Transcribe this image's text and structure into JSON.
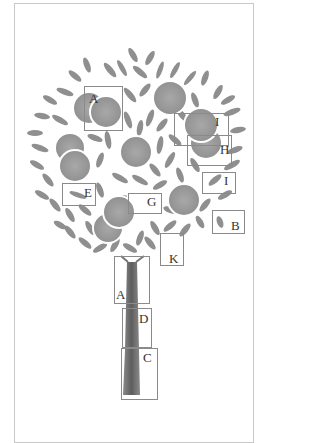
{
  "figure": {
    "title": "",
    "colors": {
      "frame": "#c8c8c8",
      "orange": "#9a9a9a",
      "leaf": "#7a7a7a",
      "trunk": "#6a6a6a",
      "box": "#8a8a8a",
      "label": "#333333"
    }
  },
  "labels": [
    {
      "id": "A_top",
      "text": "A",
      "box": [
        84,
        86,
        39,
        45
      ],
      "pos": [
        90,
        93
      ]
    },
    {
      "id": "I_upper",
      "text": "I",
      "box": [
        174,
        113,
        55,
        33
      ],
      "pos": [
        216,
        116
      ]
    },
    {
      "id": "H",
      "text": "H",
      "box": [
        187,
        135,
        45,
        31
      ],
      "pos": [
        221,
        144
      ]
    },
    {
      "id": "I_lower",
      "text": "I",
      "box": [
        202,
        172,
        34,
        22
      ],
      "pos": [
        225,
        175
      ]
    },
    {
      "id": "E",
      "text": "E",
      "box": [
        62,
        183,
        34,
        23
      ],
      "pos": [
        85,
        187
      ]
    },
    {
      "id": "G",
      "text": "G",
      "box": [
        128,
        193,
        34,
        21
      ],
      "pos": [
        148,
        196
      ]
    },
    {
      "id": "B",
      "text": "B",
      "box": [
        212,
        210,
        33,
        24
      ],
      "pos": [
        231,
        220
      ]
    },
    {
      "id": "K",
      "text": "K",
      "box": [
        160,
        233,
        24,
        33
      ],
      "pos": [
        169,
        253
      ]
    },
    {
      "id": "A_trunk",
      "text": "A",
      "box": [
        114,
        256,
        36,
        48
      ],
      "pos": [
        117,
        289
      ]
    },
    {
      "id": "D",
      "text": "D",
      "box": [
        122,
        308,
        30,
        40
      ],
      "pos": [
        140,
        313
      ]
    },
    {
      "id": "C",
      "text": "C",
      "box": [
        121,
        348,
        37,
        52
      ],
      "pos": [
        143,
        352
      ]
    }
  ]
}
